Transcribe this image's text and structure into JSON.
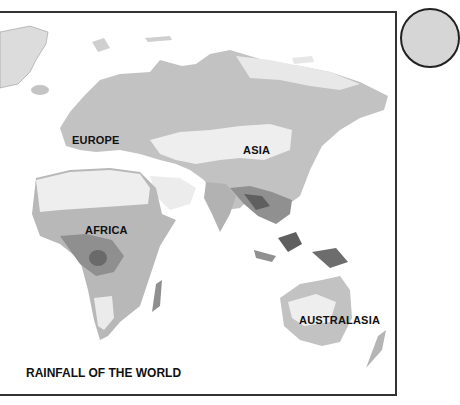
{
  "map": {
    "title": "RAINFALL OF THE WORLD",
    "regions": [
      {
        "name": "EUROPE"
      },
      {
        "name": "ASIA"
      },
      {
        "name": "AFRICA"
      },
      {
        "name": "AUSTRALASIA"
      }
    ],
    "colors": {
      "very_dry": "#eeeeee",
      "dry": "#d9d9d9",
      "moderate": "#b9b9b9",
      "wet": "#909090",
      "very_wet": "#5f5f5f",
      "border": "#333333"
    }
  }
}
